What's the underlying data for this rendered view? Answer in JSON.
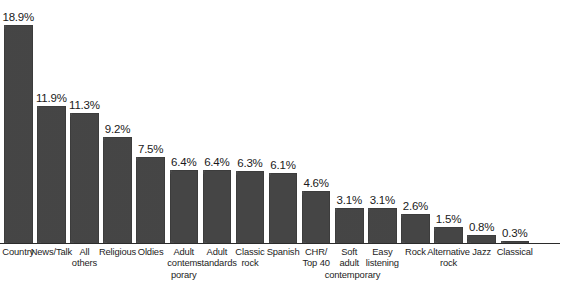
{
  "chart_data": {
    "type": "bar",
    "title": "",
    "xlabel": "",
    "ylabel": "",
    "ylim": [
      0,
      18.9
    ],
    "grid": false,
    "legend": false,
    "value_suffix": "%",
    "categories": [
      "Country",
      "News/Talk",
      "All others",
      "Religious",
      "Oldies",
      "Adult contemporary",
      "Adult standards",
      "Classic rock",
      "Spanish",
      "CHR/ Top 40",
      "Soft adult contemporary",
      "Easy listening",
      "Rock",
      "Alternative rock",
      "Jazz",
      "Classical"
    ],
    "category_lines": [
      [
        "Country"
      ],
      [
        "News/Talk"
      ],
      [
        "All",
        "others"
      ],
      [
        "Religious"
      ],
      [
        "Oldies"
      ],
      [
        "Adult",
        "contem-",
        "porary"
      ],
      [
        "Adult",
        "standards"
      ],
      [
        "Classic",
        "rock"
      ],
      [
        "Spanish"
      ],
      [
        "CHR/",
        "Top 40"
      ],
      [
        "Soft",
        "adult",
        "contemporary"
      ],
      [
        "Easy",
        "listening"
      ],
      [
        "Rock"
      ],
      [
        "Alternative",
        "rock"
      ],
      [
        "Jazz"
      ],
      [
        "Classical"
      ]
    ],
    "values": [
      18.9,
      11.9,
      11.3,
      9.2,
      7.5,
      6.4,
      6.4,
      6.3,
      6.1,
      4.6,
      3.1,
      3.1,
      2.6,
      1.5,
      0.8,
      0.3
    ],
    "value_labels": [
      "18.9%",
      "11.9%",
      "11.3%",
      "9.2%",
      "7.5%",
      "6.4%",
      "6.4%",
      "6.3%",
      "6.1%",
      "4.6%",
      "3.1%",
      "3.1%",
      "2.6%",
      "1.5%",
      "0.8%",
      "0.3%"
    ],
    "colors": {
      "bar": "#4c4c4c",
      "axis": "#2b2b2b",
      "value_text": "#1a1a1a",
      "category_text": "#1d1d1d",
      "background": "#ffffff"
    }
  }
}
